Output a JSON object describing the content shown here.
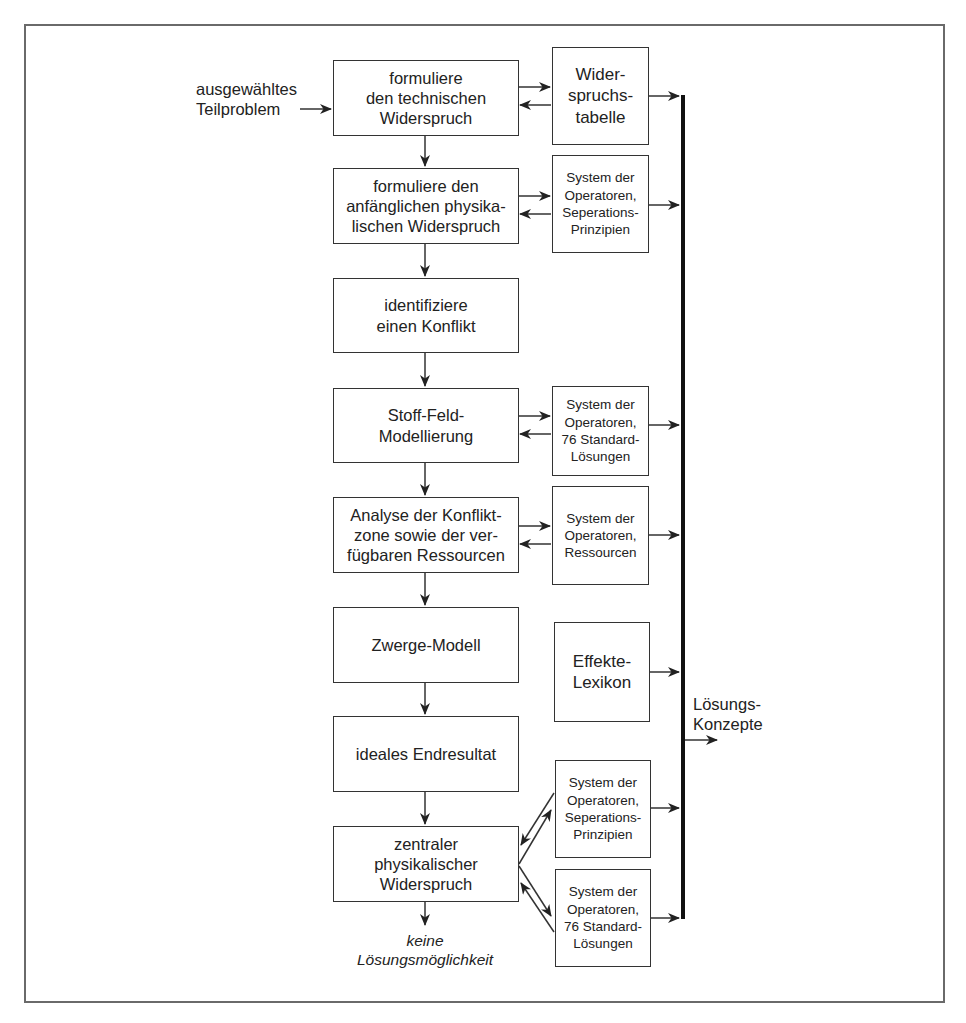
{
  "diagram": {
    "input_label": "ausgewähltes\nTeilproblem",
    "main_steps": [
      {
        "id": "step-1",
        "label": "formuliere\nden technischen\nWiderspruch"
      },
      {
        "id": "step-2",
        "label": "formuliere den\nanfänglichen physika-\nlischen Widerspruch"
      },
      {
        "id": "step-3",
        "label": "identifiziere\neinen Konflikt"
      },
      {
        "id": "step-4",
        "label": "Stoff-Feld-\nModellierung"
      },
      {
        "id": "step-5",
        "label": "Analyse der Konflikt-\nzone sowie der ver-\nfügbaren Ressourcen"
      },
      {
        "id": "step-6",
        "label": "Zwerge-Modell"
      },
      {
        "id": "step-7",
        "label": "ideales Endresultat"
      },
      {
        "id": "step-8",
        "label": "zentraler\nphysikalischer\nWiderspruch"
      }
    ],
    "tools": [
      {
        "id": "tool-1",
        "label": "Wider-\nspruchs-\ntabelle",
        "linked_step": "step-1"
      },
      {
        "id": "tool-2",
        "label": "System der\nOperatoren,\nSeperations-\nPrinzipien",
        "linked_step": "step-2"
      },
      {
        "id": "tool-3",
        "label": "System der\nOperatoren,\n76 Standard-\nLösungen",
        "linked_step": "step-4"
      },
      {
        "id": "tool-4",
        "label": "System der\nOperatoren,\nRessourcen",
        "linked_step": "step-5"
      },
      {
        "id": "tool-5",
        "label": "Effekte-\nLexikon",
        "linked_step": ""
      },
      {
        "id": "tool-6",
        "label": "System der\nOperatoren,\nSeperations-\nPrinzipien",
        "linked_step": "step-8"
      },
      {
        "id": "tool-7",
        "label": "System der\nOperatoren,\n76 Standard-\nLösungen",
        "linked_step": "step-8"
      }
    ],
    "output_label": "Lösungs-\nKonzepte",
    "fail_label": "keine\nLösungsmöglichkeit"
  }
}
